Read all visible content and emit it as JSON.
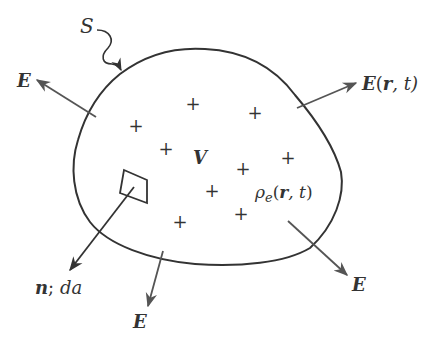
{
  "diagram": {
    "surface_label": "S",
    "volume_label": "V",
    "charge_symbol": "+",
    "charge_count": 9,
    "density_label": {
      "rho": "ρ",
      "sub": "e",
      "args_open": "(",
      "r": "r",
      "comma_t": ", t",
      "close": ")"
    },
    "field_labels": {
      "top_left": "E",
      "top_right_E": "E",
      "top_right_args_open": "(",
      "top_right_r": "r",
      "top_right_t": ", t)",
      "bottom_right": "E",
      "bottom": "E"
    },
    "normal_label": {
      "n": "n",
      "sep": "; ",
      "da": "da"
    },
    "colors": {
      "outline": "#333333",
      "arrow": "#555555",
      "text": "#333333"
    }
  }
}
